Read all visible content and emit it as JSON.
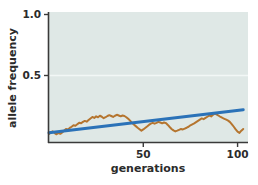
{
  "chart_data": {
    "type": "line",
    "title": "",
    "xlabel": "generations",
    "ylabel": "allele frequency",
    "xlim": [
      0,
      105
    ],
    "ylim": [
      0,
      1.05
    ],
    "xticks": [
      50,
      100
    ],
    "xticklabels": [
      "50",
      "100"
    ],
    "yticks": [
      0.5,
      1.0
    ],
    "yticklabels": [
      "0.5",
      "1.0"
    ],
    "grid": "horizontal-faint-at-0.5",
    "legend": "none",
    "plot_background_color": "#dfe8e6",
    "figure_background_color": "#ffffff",
    "gridline_color": "#f2f7f6",
    "axis_color": "#3a3a3a",
    "series": [
      {
        "name": "allele frequency trajectory",
        "type": "line",
        "color": "#b5752f",
        "linewidth": 2.0,
        "x": [
          0,
          1,
          2,
          3,
          4,
          5,
          6,
          7,
          8,
          9,
          10,
          11,
          12,
          13,
          14,
          15,
          16,
          17,
          18,
          19,
          20,
          21,
          22,
          23,
          24,
          25,
          26,
          27,
          28,
          29,
          30,
          31,
          32,
          33,
          34,
          35,
          36,
          37,
          38,
          39,
          40,
          41,
          42,
          43,
          44,
          45,
          46,
          47,
          48,
          49,
          50,
          51,
          52,
          53,
          54,
          55,
          56,
          57,
          58,
          59,
          60,
          61,
          62,
          63,
          64,
          65,
          66,
          67,
          68,
          69,
          70,
          71,
          72,
          73,
          74,
          75,
          76,
          77,
          78,
          79,
          80,
          81,
          82,
          83,
          84,
          85,
          86,
          87,
          88,
          89,
          90,
          91,
          92,
          93,
          94,
          95,
          96,
          97,
          98,
          99,
          100,
          101,
          102,
          103
        ],
        "y": [
          0.02,
          0.035,
          0.042,
          0.028,
          0.018,
          0.03,
          0.022,
          0.033,
          0.048,
          0.062,
          0.058,
          0.07,
          0.08,
          0.092,
          0.088,
          0.1,
          0.112,
          0.108,
          0.12,
          0.128,
          0.122,
          0.135,
          0.148,
          0.16,
          0.152,
          0.165,
          0.158,
          0.17,
          0.162,
          0.15,
          0.158,
          0.168,
          0.175,
          0.168,
          0.16,
          0.17,
          0.178,
          0.172,
          0.165,
          0.172,
          0.168,
          0.158,
          0.145,
          0.13,
          0.112,
          0.098,
          0.085,
          0.072,
          0.06,
          0.048,
          0.058,
          0.07,
          0.082,
          0.095,
          0.105,
          0.112,
          0.105,
          0.112,
          0.12,
          0.115,
          0.108,
          0.115,
          0.11,
          0.095,
          0.078,
          0.062,
          0.05,
          0.042,
          0.048,
          0.055,
          0.062,
          0.058,
          0.065,
          0.072,
          0.08,
          0.092,
          0.1,
          0.108,
          0.118,
          0.128,
          0.138,
          0.148,
          0.142,
          0.152,
          0.162,
          0.172,
          0.165,
          0.178,
          0.188,
          0.18,
          0.17,
          0.16,
          0.152,
          0.145,
          0.138,
          0.13,
          0.118,
          0.1,
          0.08,
          0.058,
          0.04,
          0.03,
          0.048,
          0.062
        ]
      },
      {
        "name": "expected trend",
        "type": "line",
        "color": "#2b72b8",
        "linewidth": 3.0,
        "x": [
          0,
          103
        ],
        "y": [
          0.03,
          0.22
        ]
      }
    ]
  }
}
